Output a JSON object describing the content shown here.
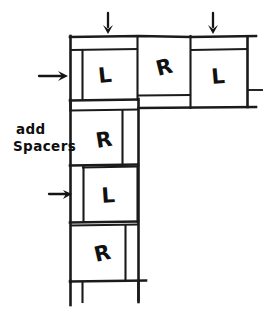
{
  "diagram": {
    "ink_color": "#1b1b1b",
    "background": "#ffffff",
    "annotation": {
      "line1": "add",
      "line2": "Spacers",
      "x": 13,
      "y": 135
    },
    "blocks": [
      {
        "id": "top-left",
        "label": "L",
        "x": 75,
        "y": 50,
        "w": 58,
        "h": 50,
        "label_x": 99,
        "label_y": 83
      },
      {
        "id": "top-middle",
        "label": "R",
        "x": 139,
        "y": 38,
        "w": 52,
        "h": 58,
        "label_x": 158,
        "label_y": 76
      },
      {
        "id": "top-right",
        "label": "L",
        "x": 191,
        "y": 50,
        "w": 56,
        "h": 58,
        "label_x": 212,
        "label_y": 84
      },
      {
        "id": "left-upper",
        "label": "R",
        "x": 75,
        "y": 111,
        "w": 58,
        "h": 54,
        "label_x": 97,
        "label_y": 148
      },
      {
        "id": "left-mid",
        "label": "L",
        "x": 84,
        "y": 167,
        "w": 54,
        "h": 55,
        "label_x": 102,
        "label_y": 203
      },
      {
        "id": "left-lower",
        "label": "R",
        "x": 75,
        "y": 225,
        "w": 63,
        "h": 56,
        "label_x": 96,
        "label_y": 262
      }
    ],
    "arrows": [
      {
        "id": "down-arrow-1",
        "direction": "down",
        "x": 108,
        "y1": 13,
        "y2": 32
      },
      {
        "id": "down-arrow-2",
        "direction": "down",
        "x": 213,
        "y1": 13,
        "y2": 32
      },
      {
        "id": "right-arrow-1",
        "direction": "right",
        "y": 76,
        "x1": 39,
        "x2": 67
      },
      {
        "id": "right-arrow-2",
        "direction": "right",
        "y": 194,
        "x1": 49,
        "x2": 72
      }
    ],
    "counts": {
      "blocks": 6,
      "l_blocks": 3,
      "r_blocks": 3,
      "down_arrows": 2,
      "right_arrows": 2
    }
  }
}
